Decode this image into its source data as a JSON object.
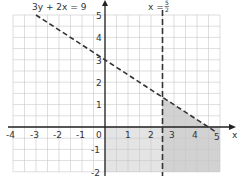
{
  "chart_data": {
    "type": "line",
    "title": "",
    "xlabel": "x",
    "ylabel": "",
    "xlim": [
      -4,
      5
    ],
    "ylim": [
      -2,
      5
    ],
    "grid": true,
    "x_ticks": [
      "-4",
      "-3",
      "-2",
      "-1",
      "0",
      "1",
      "2",
      "3",
      "4",
      "5"
    ],
    "y_ticks": [
      "5",
      "4",
      "3",
      "2",
      "1",
      "-1",
      "-2"
    ],
    "series": [
      {
        "name": "3y + 2x = 9",
        "style": "dashed",
        "points": [
          [
            -3,
            5
          ],
          [
            4.5,
            0
          ]
        ]
      },
      {
        "name": "x = 5/2",
        "style": "dashed",
        "points": [
          [
            2.5,
            -2
          ],
          [
            2.5,
            5
          ]
        ]
      }
    ],
    "shaded_regions": [
      {
        "description": "light shading below x-axis",
        "x": [
          0,
          5
        ],
        "y": [
          -2,
          0
        ]
      },
      {
        "description": "darker shading right of x = 5/2 and below 3y + 2x = 9",
        "vertices": [
          [
            2.5,
            -2
          ],
          [
            2.5,
            1.33
          ],
          [
            4.5,
            0
          ],
          [
            5,
            0
          ],
          [
            5,
            -2
          ]
        ]
      }
    ],
    "annotations": [
      "3y + 2x = 9",
      "x = 5/2"
    ]
  },
  "labels": {
    "line1": "3y + 2x = 9",
    "line2_prefix": "x =",
    "line2_num": "5",
    "line2_den": "2",
    "x_axis": "x",
    "x_ticks": [
      "-4",
      "-3",
      "-2",
      "-1",
      "0",
      "1",
      "2",
      "3",
      "4",
      "5"
    ],
    "y_ticks": [
      "5",
      "4",
      "3",
      "2",
      "1",
      "-1",
      "-2"
    ]
  }
}
